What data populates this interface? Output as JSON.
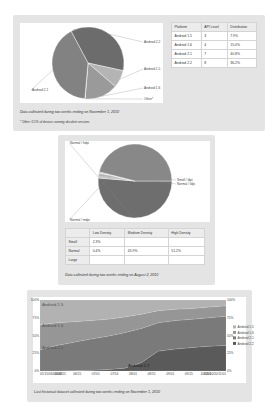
{
  "colors": {
    "panel_bg": "#e4e4e4",
    "pie_dark": "#6c6c6c",
    "pie_mid": "#7f7f7f",
    "pie_light": "#a8a8a8",
    "pie_lighter": "#bdbdbd"
  },
  "platform_section": {
    "table": {
      "headers": [
        "Platform",
        "API Level",
        "Distribution"
      ],
      "rows": [
        [
          "Android 1.5",
          "3",
          "7.9%"
        ],
        [
          "Android 1.6",
          "4",
          "15.0%"
        ],
        [
          "Android 2.1",
          "7",
          "40.8%"
        ],
        [
          "Android 2.2",
          "8",
          "36.2%"
        ]
      ]
    },
    "caption": "Data collected during two weeks ending on November 1, 2010",
    "footnote": "* Other: 0.1% of devices running obsolete versions"
  },
  "screen_section": {
    "table": {
      "headers": [
        "",
        "Low Density",
        "Medium Density",
        "High Density"
      ],
      "rows": [
        [
          "Small",
          "2.3%",
          "",
          ""
        ],
        [
          "Normal",
          "0.4%",
          "45.9%",
          "51.2%"
        ],
        [
          "Large",
          "",
          "",
          ""
        ]
      ]
    },
    "caption": "Data collected during two weeks ending on August 2, 2010"
  },
  "history_section": {
    "caption": "Last historical dataset collected during two weeks ending on November 1, 2010"
  },
  "chart_data": [
    {
      "type": "pie",
      "title": "",
      "slices": [
        {
          "label": "Android 2.2",
          "value": 36.2,
          "color": "#6c6c6c"
        },
        {
          "label": "Android 1.5",
          "value": 7.9,
          "color": "#b4b4b4"
        },
        {
          "label": "Android 1.6",
          "value": 15.0,
          "color": "#9a9a9a"
        },
        {
          "label": "Other*",
          "value": 0.1,
          "color": "#d0d0d0"
        },
        {
          "label": "Android 2.1",
          "value": 40.8,
          "color": "#828282"
        }
      ]
    },
    {
      "type": "pie",
      "title": "",
      "slices": [
        {
          "label": "Normal / hdpi",
          "value": 51.2,
          "color": "#6e6e6e"
        },
        {
          "label": "Small / ldpi",
          "value": 2.3,
          "color": "#c4c4c4"
        },
        {
          "label": "Normal / ldpi",
          "value": 0.4,
          "color": "#d8d8d8"
        },
        {
          "label": "Normal / mdpi",
          "value": 45.9,
          "color": "#888888"
        }
      ]
    },
    {
      "type": "area",
      "stacked": true,
      "title": "",
      "x_tick_labels": [
        "05/15",
        "06/01",
        "06/15",
        "07/01",
        "07/15",
        "08/01",
        "08/15",
        "09/01",
        "09/15",
        "10/01",
        "10/15",
        "11/01"
      ],
      "x_tick_labels_raw": [
        "05/15/06/01/06/15",
        "06/01",
        "06/15",
        "07/01",
        "07/14",
        "08/01",
        "08/15",
        "09/01",
        "09/15",
        "10/01",
        "10/15/10/20/11/01"
      ],
      "y_tick_labels": [
        "0%",
        "25%",
        "50%",
        "75%",
        "100%"
      ],
      "ylim": [
        0,
        100
      ],
      "grid": false,
      "legend_position": "right",
      "legend": [
        "Android 1.5",
        "Android 1.6",
        "Android 2.1",
        "Android 2.2"
      ],
      "area_labels": [
        "Android 1.5",
        "Android 1.6",
        "Android 2.1",
        "Android 2.2"
      ],
      "x": [
        0,
        1,
        2,
        3,
        4,
        5,
        6,
        7,
        8,
        9,
        10,
        11
      ],
      "series": [
        {
          "name": "Android 2.2",
          "color": "#5a5a5a",
          "values": [
            0,
            0,
            0.5,
            1,
            2,
            4,
            12,
            28,
            31,
            33,
            35,
            36
          ]
        },
        {
          "name": "Android 2.1",
          "color": "#7a7a7a",
          "values": [
            30,
            36,
            40,
            44,
            47,
            50,
            48,
            40,
            40,
            40,
            40,
            41
          ]
        },
        {
          "name": "Android 1.6",
          "color": "#969696",
          "values": [
            35,
            32,
            29,
            26,
            24,
            22,
            20,
            17,
            16,
            15,
            15,
            15
          ]
        },
        {
          "name": "Android 1.5",
          "color": "#b2b2b2",
          "values": [
            35,
            32,
            30.5,
            29,
            27,
            24,
            20,
            15,
            13,
            12,
            10,
            8
          ]
        }
      ]
    }
  ]
}
